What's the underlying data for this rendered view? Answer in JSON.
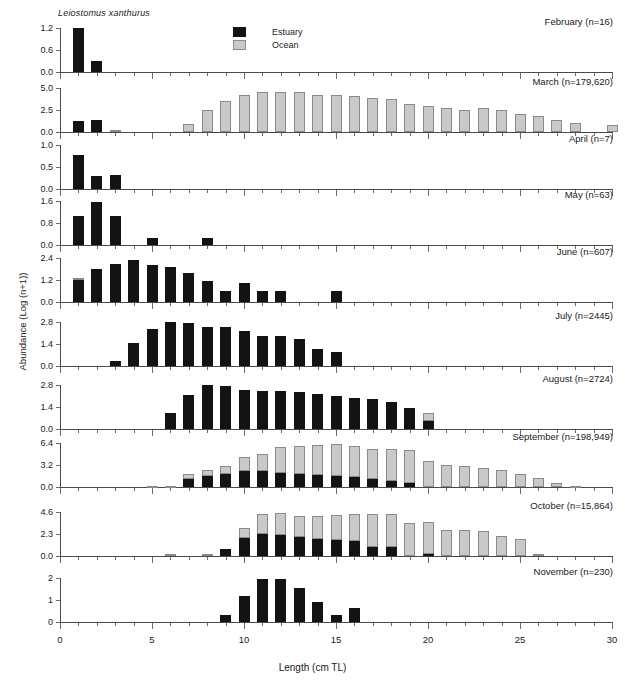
{
  "figure": {
    "species": "Leiostomus xanthurus",
    "xlabel": "Length (cm TL)",
    "ylabel": "Abundance (Log (n+1))",
    "x_range": [
      0,
      30
    ],
    "x_major_ticks": [
      0,
      5,
      10,
      15,
      20,
      25,
      30
    ],
    "x_tick_labels": [
      "0",
      "5",
      "10",
      "15",
      "20",
      "25",
      "30"
    ],
    "x_minor_tick_step": 1
  },
  "legend": {
    "position": "top-center",
    "items": [
      {
        "label": "Estuary",
        "color": "#131313",
        "key": "estuary"
      },
      {
        "label": "Ocean",
        "color": "#c9c9c9",
        "key": "ocean"
      }
    ]
  },
  "chart_data": {
    "type": "bar",
    "title": "Leiostomus xanthurus",
    "xlabel": "Length (cm TL)",
    "ylabel": "Abundance (Log (n+1))",
    "xlim": [
      0,
      30
    ],
    "grid": false,
    "stacked": true,
    "series_names": [
      "Estuary",
      "Ocean"
    ],
    "series_colors": [
      "#131313",
      "#c9c9c9"
    ],
    "panels": [
      {
        "label": "February (n=16)",
        "month": "February",
        "n": "16",
        "ylim": [
          0,
          1.2
        ],
        "yticks": [
          0.0,
          0.6,
          1.2
        ],
        "ytick_labels": [
          "0.0",
          "0.6",
          "1.2"
        ],
        "x": [
          1,
          2
        ],
        "estuary": [
          1.2,
          0.3
        ],
        "ocean": [
          0,
          0
        ]
      },
      {
        "label": "March (n=179,620)",
        "month": "March",
        "n": "179,620",
        "ylim": [
          0,
          5.0
        ],
        "yticks": [
          0.0,
          2.5,
          5.0
        ],
        "ytick_labels": [
          "0.0",
          "2.5",
          "5.0"
        ],
        "x": [
          1,
          2,
          3,
          7,
          8,
          9,
          10,
          11,
          12,
          13,
          14,
          15,
          16,
          17,
          18,
          19,
          20,
          21,
          22,
          23,
          24,
          25,
          26,
          27,
          28,
          30
        ],
        "estuary": [
          1.25,
          1.32,
          0,
          0,
          0,
          0,
          0,
          0,
          0,
          0,
          0,
          0,
          0,
          0,
          0,
          0,
          0,
          0,
          0,
          0,
          0,
          0,
          0,
          0,
          0,
          0
        ],
        "ocean": [
          0,
          0,
          0.2,
          0.9,
          2.5,
          3.5,
          4.2,
          4.55,
          4.55,
          4.55,
          4.25,
          4.15,
          4.05,
          3.9,
          3.75,
          3.2,
          3.0,
          2.75,
          2.5,
          2.7,
          2.45,
          2.0,
          1.8,
          1.35,
          1.05,
          0.8
        ]
      },
      {
        "label": "April (n=7)",
        "month": "April",
        "n": "7",
        "ylim": [
          0,
          1.0
        ],
        "yticks": [
          0.0,
          0.5,
          1.0
        ],
        "ytick_labels": [
          "0.0",
          "0.5",
          "1.0"
        ],
        "x": [
          1,
          2,
          3
        ],
        "estuary": [
          0.78,
          0.3,
          0.32
        ],
        "ocean": [
          0,
          0,
          0
        ]
      },
      {
        "label": "May (n=63)",
        "month": "May",
        "n": "63",
        "ylim": [
          0,
          1.6
        ],
        "yticks": [
          0.0,
          0.8,
          1.6
        ],
        "ytick_labels": [
          "0.0",
          "0.8",
          "1.6"
        ],
        "x": [
          1,
          2,
          3,
          5,
          8
        ],
        "estuary": [
          1.05,
          1.55,
          1.05,
          0.25,
          0.25
        ],
        "ocean": [
          0,
          0,
          0,
          0,
          0
        ]
      },
      {
        "label": "June (n=607)",
        "month": "June",
        "n": "607",
        "ylim": [
          0,
          2.4
        ],
        "yticks": [
          0.0,
          1.2,
          2.4
        ],
        "ytick_labels": [
          "0.0",
          "1.2",
          "2.4"
        ],
        "x": [
          1,
          2,
          3,
          4,
          5,
          6,
          7,
          8,
          9,
          10,
          11,
          12,
          15
        ],
        "estuary": [
          1.18,
          1.8,
          2.05,
          2.3,
          2.0,
          1.9,
          1.6,
          1.15,
          0.6,
          1.05,
          0.6,
          0.6,
          0.6
        ],
        "ocean": [
          0.15,
          0,
          0,
          0,
          0,
          0,
          0,
          0,
          0,
          0,
          0,
          0,
          0
        ]
      },
      {
        "label": "July (n=2445)",
        "month": "July",
        "n": "2445",
        "ylim": [
          0,
          2.8
        ],
        "yticks": [
          0.0,
          1.4,
          2.8
        ],
        "ytick_labels": [
          "0.0",
          "1.4",
          "2.8"
        ],
        "x": [
          3,
          4,
          5,
          6,
          7,
          8,
          9,
          10,
          11,
          12,
          13,
          14,
          15
        ],
        "estuary": [
          0.35,
          1.45,
          2.35,
          2.78,
          2.76,
          2.5,
          2.5,
          2.25,
          1.9,
          1.9,
          1.7,
          1.1,
          0.9
        ],
        "ocean": [
          0,
          0,
          0,
          0,
          0,
          0,
          0,
          0,
          0,
          0,
          0,
          0,
          0
        ]
      },
      {
        "label": "August (n=2724)",
        "month": "August",
        "n": "2724",
        "ylim": [
          0,
          2.8
        ],
        "yticks": [
          0.0,
          1.4,
          2.8
        ],
        "ytick_labels": [
          "0.0",
          "1.4",
          "2.8"
        ],
        "x": [
          6,
          7,
          8,
          9,
          10,
          11,
          12,
          13,
          14,
          15,
          16,
          17,
          18,
          19,
          20
        ],
        "estuary": [
          1.0,
          2.15,
          2.78,
          2.75,
          2.5,
          2.42,
          2.42,
          2.35,
          2.2,
          2.1,
          1.95,
          1.9,
          1.7,
          1.35,
          0.5
        ],
        "ocean": [
          0,
          0,
          0,
          0,
          0,
          0,
          0,
          0,
          0,
          0,
          0,
          0,
          0,
          0,
          0.5
        ]
      },
      {
        "label": "September (n=198,949)",
        "month": "September",
        "n": "198,949",
        "ylim": [
          0,
          6.4
        ],
        "yticks": [
          0.0,
          3.2,
          6.4
        ],
        "ytick_labels": [
          "0.0",
          "3.2",
          "6.4"
        ],
        "x": [
          5,
          6,
          7,
          8,
          9,
          10,
          11,
          12,
          13,
          14,
          15,
          16,
          17,
          18,
          19,
          20,
          21,
          22,
          23,
          24,
          25,
          26,
          27,
          28
        ],
        "estuary": [
          0,
          0,
          1.1,
          1.6,
          1.9,
          2.4,
          2.4,
          2.0,
          1.85,
          1.8,
          1.6,
          1.45,
          1.2,
          0.9,
          0.6,
          0,
          0,
          0,
          0,
          0,
          0,
          0,
          0,
          0
        ],
        "ocean": [
          0.15,
          0.15,
          0.75,
          0.9,
          1.2,
          2.0,
          2.35,
          3.8,
          4.1,
          4.3,
          4.6,
          4.45,
          4.4,
          4.7,
          4.8,
          3.8,
          3.25,
          3.05,
          2.8,
          2.5,
          1.9,
          1.3,
          0.6,
          0.15
        ]
      },
      {
        "label": "October (n=15,864)",
        "month": "October",
        "n": "15,864",
        "ylim": [
          0,
          4.6
        ],
        "yticks": [
          0.0,
          2.3,
          4.6
        ],
        "ytick_labels": [
          "0.0",
          "2.3",
          "4.6"
        ],
        "x": [
          6,
          8,
          9,
          10,
          11,
          12,
          13,
          14,
          15,
          16,
          17,
          18,
          19,
          20,
          21,
          22,
          23,
          24,
          25,
          26
        ],
        "estuary": [
          0,
          0,
          0.7,
          1.85,
          2.25,
          2.2,
          1.95,
          1.8,
          1.65,
          1.6,
          0.95,
          0.95,
          0,
          0.2,
          0,
          0,
          0,
          0,
          0,
          0
        ],
        "ocean": [
          0.2,
          0.2,
          0,
          1.1,
          2.15,
          2.3,
          2.2,
          2.4,
          2.6,
          2.75,
          3.4,
          3.45,
          3.5,
          3.35,
          2.75,
          2.7,
          2.6,
          2.1,
          1.8,
          0.25
        ]
      },
      {
        "label": "November (n=230)",
        "month": "November",
        "n": "230",
        "ylim": [
          0,
          2
        ],
        "yticks": [
          0,
          1,
          2
        ],
        "ytick_labels": [
          "0",
          "1",
          "2"
        ],
        "x": [
          9,
          10,
          11,
          12,
          13,
          14,
          15,
          16
        ],
        "estuary": [
          0.3,
          1.2,
          1.95,
          1.95,
          1.55,
          0.92,
          0.3,
          0.62
        ],
        "ocean": [
          0,
          0,
          0,
          0,
          0,
          0,
          0,
          0
        ]
      }
    ]
  },
  "october_extra": {
    "bars_at": [
      21,
      22,
      23
    ],
    "values": [
      0.1,
      0.25,
      0.12
    ]
  }
}
